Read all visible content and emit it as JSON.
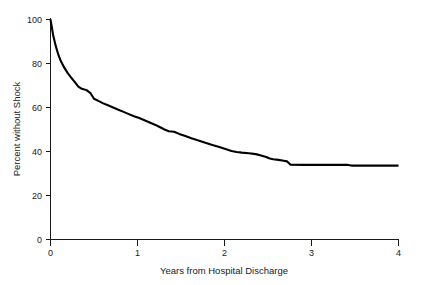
{
  "chart_data": {
    "type": "line",
    "title": "",
    "subtitle": "",
    "xlabel": "Years from Hospital Discharge",
    "ylabel": "Percent without Shock",
    "xlim": [
      0,
      4
    ],
    "ylim": [
      0,
      100
    ],
    "xticks": [
      0,
      1,
      2,
      3,
      4
    ],
    "xticklabels": [
      "0",
      "1",
      "2",
      "3",
      "4"
    ],
    "yticks": [
      0,
      20,
      40,
      60,
      80,
      100
    ],
    "yticklabels": [
      "0",
      "20",
      "40",
      "60",
      "80",
      "100"
    ],
    "grid": false,
    "legend": null,
    "annotations": [],
    "line_color": "#000000",
    "series": [
      {
        "name": "Percent without shock",
        "style": "kaplan-meier step/smoothed survival curve",
        "x": [
          0.0,
          0.03,
          0.06,
          0.09,
          0.12,
          0.16,
          0.2,
          0.24,
          0.28,
          0.32,
          0.36,
          0.41,
          0.46,
          0.5,
          0.55,
          0.6,
          0.66,
          0.72,
          0.78,
          0.84,
          0.9,
          0.96,
          1.02,
          1.08,
          1.14,
          1.2,
          1.26,
          1.31,
          1.36,
          1.42,
          1.48,
          1.55,
          1.62,
          1.7,
          1.78,
          1.86,
          1.94,
          2.02,
          2.08,
          2.14,
          2.2,
          2.28,
          2.36,
          2.42,
          2.48,
          2.52,
          2.56,
          2.62,
          2.68,
          2.72,
          2.76,
          2.9,
          3.1,
          3.3,
          3.42,
          3.46,
          3.7,
          4.0
        ],
        "y": [
          100.0,
          93.0,
          88.0,
          84.0,
          81.0,
          78.0,
          75.5,
          73.5,
          71.5,
          69.5,
          68.5,
          68.0,
          66.5,
          64.0,
          63.0,
          62.0,
          61.0,
          60.0,
          59.0,
          58.0,
          57.0,
          56.0,
          55.2,
          54.2,
          53.2,
          52.2,
          51.0,
          50.0,
          49.2,
          49.0,
          48.0,
          47.0,
          46.0,
          45.0,
          44.0,
          43.0,
          42.0,
          41.0,
          40.2,
          39.8,
          39.5,
          39.2,
          38.8,
          38.2,
          37.5,
          36.8,
          36.5,
          36.2,
          35.8,
          35.5,
          34.0,
          33.9,
          33.9,
          33.9,
          33.9,
          33.6,
          33.6,
          33.6
        ]
      }
    ],
    "key_values": {
      "start_percent": 100,
      "percent_at_1_year": 56,
      "percent_at_2_years": 41,
      "percent_at_3_years": 34,
      "percent_at_4_years": 33.6
    }
  },
  "axes": {
    "x_axis_name": "Years from Hospital Discharge",
    "y_axis_name": "Percent without Shock"
  }
}
